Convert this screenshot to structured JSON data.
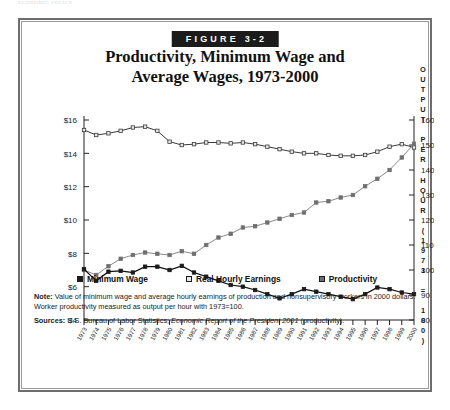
{
  "running_head": "ECONOMIC POLICY",
  "figure": {
    "badge": "FIGURE 3-2",
    "title_line1": "Productivity, Minimum Wage and",
    "title_line2": "Average Wages, 1973-2000"
  },
  "legend": {
    "items": [
      {
        "label": "Minimum Wage",
        "color": "#1b1b1b"
      },
      {
        "label": "Real Hourly Earnings",
        "color": "#e8e8e8"
      },
      {
        "label": "Productivity",
        "color": "#6f6f6f"
      }
    ]
  },
  "notes": {
    "note_label": "Note:",
    "note_text": " Value of minimum wage and average hourly earnings of production and nonsupervisory workers in 2000 dollars. Worker productivity measured as output per hour with 1973=100.",
    "sources_label": "Sources:",
    "sources_pre": " U.S. Bureau of Labor Statistics; ",
    "sources_italic": "Economic Report of the President 2001",
    "sources_post": " (productivity)."
  },
  "chart_data": {
    "type": "line",
    "title": "Productivity, Minimum Wage and Average Wages, 1973-2000",
    "xlabel": "",
    "ylabel": "",
    "grid": false,
    "legend_position": "bottom",
    "x": [
      1973,
      1974,
      1975,
      1976,
      1977,
      1978,
      1979,
      1980,
      1981,
      1982,
      1983,
      1984,
      1985,
      1986,
      1987,
      1988,
      1989,
      1990,
      1991,
      1992,
      1993,
      1994,
      1995,
      1996,
      1997,
      1998,
      1999,
      2000
    ],
    "xtick_labels": [
      "1973",
      "1974",
      "1975",
      "1976",
      "1977",
      "1978",
      "1979",
      "1980",
      "1981",
      "1982",
      "1983",
      "1984",
      "1985",
      "1986",
      "1987",
      "1988",
      "1989",
      "1990",
      "1991",
      "1992",
      "1993",
      "1994",
      "1995",
      "1996",
      "1997",
      "1998",
      "1999",
      "2000"
    ],
    "left_axis": {
      "label": "",
      "ticks": [
        "$4",
        "$6",
        "$8",
        "$10",
        "$12",
        "$14",
        "$16"
      ],
      "tick_values": [
        4,
        6,
        8,
        10,
        12,
        14,
        16
      ],
      "ylim": [
        4,
        16
      ]
    },
    "right_axis": {
      "label": "OUTPUT PER HOUR (1973 = 100)",
      "ticks": [
        "80",
        "90",
        "100",
        "110",
        "120",
        "130",
        "140",
        "150",
        "160"
      ],
      "tick_values": [
        80,
        90,
        100,
        110,
        120,
        130,
        140,
        150,
        160
      ],
      "ylim": [
        80,
        160
      ]
    },
    "series": [
      {
        "name": "Minimum Wage",
        "axis": "left",
        "units": "2000 dollars per hour",
        "marker": "filled-square",
        "color": "#1b1b1b",
        "values": [
          7.05,
          6.35,
          6.9,
          6.95,
          6.85,
          7.2,
          7.2,
          7.0,
          7.25,
          6.85,
          6.6,
          6.35,
          6.1,
          6.0,
          5.8,
          5.55,
          5.3,
          5.55,
          5.85,
          5.7,
          5.55,
          5.4,
          5.25,
          5.55,
          5.95,
          5.85,
          5.65,
          5.55
        ]
      },
      {
        "name": "Real Hourly Earnings",
        "axis": "left",
        "units": "2000 dollars per hour",
        "marker": "open-square",
        "color": "#e8e8e8",
        "values": [
          15.4,
          15.1,
          15.2,
          15.35,
          15.55,
          15.6,
          15.35,
          14.7,
          14.5,
          14.55,
          14.65,
          14.65,
          14.6,
          14.65,
          14.55,
          14.4,
          14.25,
          14.1,
          14.0,
          14.0,
          13.9,
          13.85,
          13.85,
          13.9,
          14.1,
          14.4,
          14.55,
          14.35
        ]
      },
      {
        "name": "Productivity",
        "axis": "right",
        "units": "index, 1973 = 100",
        "marker": "filled-square",
        "color": "#6f6f6f",
        "values": [
          100.0,
          98.0,
          101.5,
          104.5,
          106.0,
          107.0,
          106.5,
          106.0,
          107.5,
          106.5,
          110.0,
          113.0,
          114.5,
          117.0,
          117.5,
          119.0,
          120.5,
          122.0,
          123.0,
          127.0,
          127.5,
          129.0,
          130.0,
          133.5,
          136.5,
          140.0,
          145.0,
          150.5
        ]
      }
    ]
  }
}
